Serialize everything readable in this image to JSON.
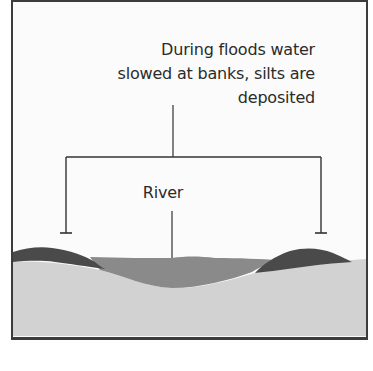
{
  "diagram": {
    "annotation": {
      "lines": [
        "During floods water",
        "slowed at banks, silts are",
        "deposited"
      ]
    },
    "labels": {
      "river": "River"
    },
    "layers": {
      "floodplain": {
        "name": "floodplain-ground",
        "color": "#d2d2d2"
      },
      "river_water": {
        "name": "river-water",
        "color": "#8a8a8a"
      },
      "left_levee": {
        "name": "left-levee-silt",
        "color": "#4a4a4a"
      },
      "right_levee": {
        "name": "right-levee-silt",
        "color": "#4a4a4a"
      }
    },
    "colors": {
      "frame_border": "#3c3c3c",
      "line": "#333333",
      "text": "#2b2b2b",
      "background": "#fbfbfb"
    }
  }
}
